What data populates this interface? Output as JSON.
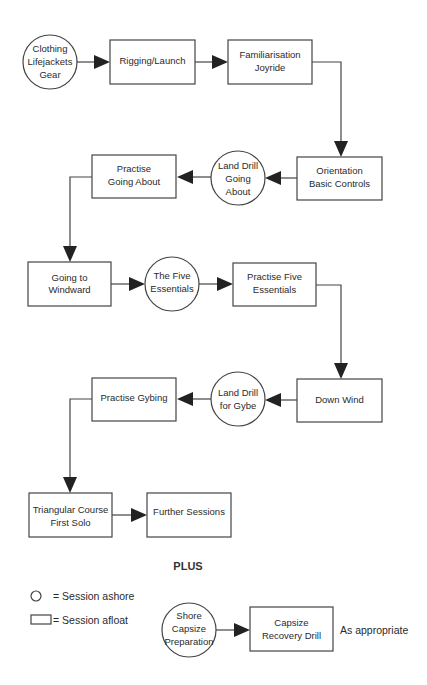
{
  "diagram": {
    "type": "flowchart",
    "nodes": [
      {
        "id": "clothing",
        "shape": "circle",
        "kind": "Session ashore",
        "lines": [
          "Clothing",
          "Lifejackets",
          "Gear"
        ]
      },
      {
        "id": "rigging",
        "shape": "rect",
        "kind": "Session afloat",
        "lines": [
          "Rigging/Launch"
        ]
      },
      {
        "id": "familiarisation",
        "shape": "rect",
        "kind": "Session afloat",
        "lines": [
          "Familiarisation",
          "Joyride"
        ]
      },
      {
        "id": "orientation",
        "shape": "rect",
        "kind": "Session afloat",
        "lines": [
          "Orientation",
          "Basic Controls"
        ]
      },
      {
        "id": "land_drill_about",
        "shape": "circle",
        "kind": "Session ashore",
        "lines": [
          "Land Drill",
          "Going",
          "About"
        ]
      },
      {
        "id": "practise_about",
        "shape": "rect",
        "kind": "Session afloat",
        "lines": [
          "Practise",
          "Going About"
        ]
      },
      {
        "id": "windward",
        "shape": "rect",
        "kind": "Session afloat",
        "lines": [
          "Going to",
          "Windward"
        ]
      },
      {
        "id": "five_essentials",
        "shape": "circle",
        "kind": "Session ashore",
        "lines": [
          "The Five",
          "Essentials"
        ]
      },
      {
        "id": "practise_five",
        "shape": "rect",
        "kind": "Session afloat",
        "lines": [
          "Practise Five",
          "Essentials"
        ]
      },
      {
        "id": "down_wind",
        "shape": "rect",
        "kind": "Session afloat",
        "lines": [
          "Down Wind"
        ]
      },
      {
        "id": "land_drill_gybe",
        "shape": "circle",
        "kind": "Session ashore",
        "lines": [
          "Land Drill",
          "for Gybe"
        ]
      },
      {
        "id": "practise_gybing",
        "shape": "rect",
        "kind": "Session afloat",
        "lines": [
          "Practise Gybing"
        ]
      },
      {
        "id": "triangular",
        "shape": "rect",
        "kind": "Session afloat",
        "lines": [
          "Triangular Course",
          "First Solo"
        ]
      },
      {
        "id": "further",
        "shape": "rect",
        "kind": "Session afloat",
        "lines": [
          "Further Sessions"
        ]
      },
      {
        "id": "shore_capsize",
        "shape": "circle",
        "kind": "Session ashore",
        "lines": [
          "Shore",
          "Capsize",
          "Preparation"
        ]
      },
      {
        "id": "capsize_recovery",
        "shape": "rect",
        "kind": "Session afloat",
        "lines": [
          "Capsize",
          "Recovery Drill"
        ]
      }
    ],
    "edges": [
      [
        "clothing",
        "rigging"
      ],
      [
        "rigging",
        "familiarisation"
      ],
      [
        "familiarisation",
        "orientation"
      ],
      [
        "orientation",
        "land_drill_about"
      ],
      [
        "land_drill_about",
        "practise_about"
      ],
      [
        "practise_about",
        "windward"
      ],
      [
        "windward",
        "five_essentials"
      ],
      [
        "five_essentials",
        "practise_five"
      ],
      [
        "practise_five",
        "down_wind"
      ],
      [
        "down_wind",
        "land_drill_gybe"
      ],
      [
        "land_drill_gybe",
        "practise_gybing"
      ],
      [
        "practise_gybing",
        "triangular"
      ],
      [
        "triangular",
        "further"
      ],
      [
        "shore_capsize",
        "capsize_recovery"
      ]
    ],
    "plus_label": "PLUS",
    "capsize_note": "As appropriate"
  },
  "legend": {
    "circle_label": "= Session ashore",
    "rect_label": "= Session afloat"
  },
  "colors": {
    "stroke": "#444444",
    "arrow": "#222222",
    "text": "#2a2a2a",
    "background": "#ffffff"
  }
}
